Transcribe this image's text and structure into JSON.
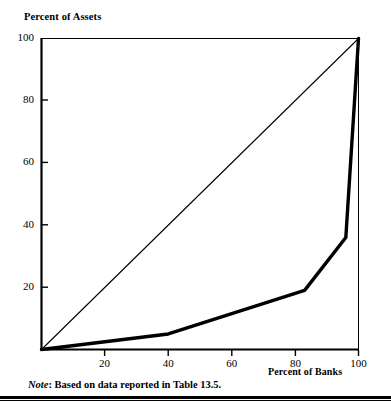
{
  "figure": {
    "note_prefix": "Note",
    "note_separator": ":",
    "note_text": " Based on data reported in Table 13.5.",
    "background_color": "#ffffff",
    "ink_color": "#000000"
  },
  "chart_data": {
    "type": "line",
    "title": "",
    "ylabel": "Percent of Assets",
    "xlabel": "Percent of Banks",
    "xlim": [
      0,
      100
    ],
    "ylim": [
      0,
      100
    ],
    "grid": false,
    "legend": "none",
    "x_ticks": [
      20,
      40,
      60,
      80,
      100
    ],
    "y_ticks": [
      20,
      40,
      60,
      80,
      100
    ],
    "x_tick_labels": [
      "20",
      "40",
      "60",
      "80",
      "100"
    ],
    "y_tick_labels": [
      "20",
      "40",
      "60",
      "80",
      "100"
    ],
    "series": [
      {
        "name": "line-of-equality",
        "style": "thin",
        "x": [
          0,
          100
        ],
        "y": [
          0,
          100
        ]
      },
      {
        "name": "lorenz-curve",
        "style": "thick",
        "x": [
          0,
          40,
          83,
          96,
          100
        ],
        "y": [
          0,
          5,
          19,
          36,
          100
        ]
      }
    ]
  }
}
